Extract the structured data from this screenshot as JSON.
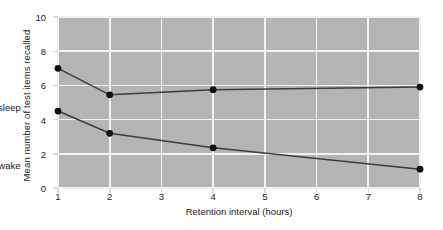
{
  "chart_data": {
    "type": "line",
    "title": "",
    "subtitle": "",
    "xlabel": "Retention interval (hours)",
    "ylabel": "Mean number of test items recalled",
    "categories": [
      "1",
      "2",
      "3",
      "4",
      "5",
      "6",
      "7",
      "8"
    ],
    "x_tick_labels": [
      "1",
      "2",
      "3",
      "4",
      "5",
      "6",
      "7",
      "8"
    ],
    "y_tick_labels": [
      "0",
      "2",
      "4",
      "6",
      "8",
      "10"
    ],
    "y_ticks": [
      0,
      2,
      4,
      6,
      8,
      10
    ],
    "ylim": [
      0,
      10
    ],
    "xlim_categories": [
      "1",
      "8"
    ],
    "grid": "both-white-on-gray",
    "legend_position": "inline-annotations",
    "plot_background": "#b4b4b4",
    "page_background": "#ffffff",
    "grid_color": "#f2f2f2",
    "line_color": "#3c3c3c",
    "marker_color": "#101010",
    "series": [
      {
        "name": "Asleep",
        "label": "Asleep",
        "x": [
          "1",
          "2",
          "4",
          "8"
        ],
        "values": [
          7.0,
          5.45,
          5.75,
          5.9
        ],
        "label_x": "6.2",
        "label_y": 4.75
      },
      {
        "name": "Awake",
        "label": "Awake",
        "x": [
          "1",
          "2",
          "4",
          "8"
        ],
        "values": [
          4.5,
          3.2,
          2.35,
          1.1
        ],
        "label_x": "6.3",
        "label_y": 1.35
      }
    ],
    "annotations": [
      {
        "text": "Asleep",
        "series": "Asleep"
      },
      {
        "text": "Awake",
        "series": "Awake"
      }
    ]
  }
}
